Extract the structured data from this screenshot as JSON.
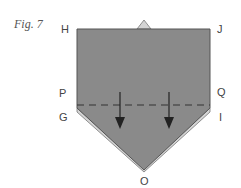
{
  "figure": {
    "caption": "Fig. 7",
    "labels": {
      "H": "H",
      "J": "J",
      "P": "P",
      "Q": "Q",
      "G": "G",
      "I": "I",
      "O": "O"
    },
    "colors": {
      "paper_front": "#8a8a8a",
      "paper_back": "#d4d4d4",
      "outline": "#555555",
      "dash": "#333333",
      "arrow": "#222222",
      "label": "#444444"
    },
    "annotations": {
      "fold_line": "valley fold (dashed) along P–Q",
      "arrows": [
        "fold-down-arrow-left",
        "fold-down-arrow-right"
      ]
    }
  }
}
